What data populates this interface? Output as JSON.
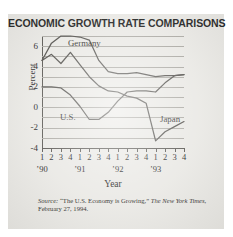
{
  "figure": {
    "title": "ECONOMIC GROWTH RATE COMPARISONS",
    "x_axis_title": "Year",
    "y_axis_title": "Percent",
    "source": {
      "label": "Source:",
      "article": "“The U.S. Economy is Growing,”",
      "publication": "The New York Times",
      "date": ", February 27, 1994."
    },
    "colors": {
      "paper": "#e9e8e4",
      "ink": "#1d1d1d",
      "line": "#4e4c48",
      "grid": "#a9a7a1",
      "axis": "#55534e"
    }
  },
  "chart_data": {
    "type": "line",
    "title": "ECONOMIC GROWTH RATE COMPARISONS",
    "xlabel": "Year",
    "ylabel": "Percent",
    "ylim": [
      -4,
      7
    ],
    "xlim": [
      0,
      15
    ],
    "grid": true,
    "grid_interval": 1,
    "legend_position": "inline-labels",
    "y_ticks": [
      "6",
      "4",
      "2",
      "0",
      "-2",
      "-4"
    ],
    "y_tick_values": [
      6,
      4,
      2,
      0,
      -2,
      -4
    ],
    "quarter_ticks": [
      "1",
      "2",
      "3",
      "4",
      "1",
      "2",
      "3",
      "4",
      "1",
      "2",
      "3",
      "4",
      "1",
      "2",
      "3",
      "4"
    ],
    "year_ticks": [
      "’90",
      "’91",
      "’92",
      "’93"
    ],
    "x": [
      "'90 Q1",
      "'90 Q2",
      "'90 Q3",
      "'90 Q4",
      "'91 Q1",
      "'91 Q2",
      "'91 Q3",
      "'91 Q4",
      "'92 Q1",
      "'92 Q2",
      "'92 Q3",
      "'92 Q4",
      "'93 Q1",
      "'93 Q2",
      "'93 Q3",
      "'93 Q4"
    ],
    "series": [
      {
        "name": "Germany",
        "label": "Germany",
        "values": [
          4.6,
          6.3,
          7.0,
          7.0,
          6.9,
          6.6,
          4.6,
          3.5,
          3.3,
          3.3,
          3.4,
          3.2,
          3.0,
          3.1,
          3.1,
          3.2
        ]
      },
      {
        "name": "U.S.",
        "label": "U.S.",
        "values": [
          2.0,
          2.0,
          1.9,
          1.2,
          0.1,
          -1.2,
          -1.2,
          -0.5,
          0.6,
          1.5,
          1.6,
          1.6,
          1.5,
          2.4,
          3.1,
          3.2
        ]
      },
      {
        "name": "Japan",
        "label": "Japan",
        "values": [
          4.6,
          5.2,
          4.3,
          5.4,
          4.2,
          3.0,
          2.1,
          1.6,
          1.5,
          1.1,
          0.9,
          0.4,
          -3.3,
          -2.4,
          -1.9,
          -1.4
        ]
      }
    ]
  }
}
